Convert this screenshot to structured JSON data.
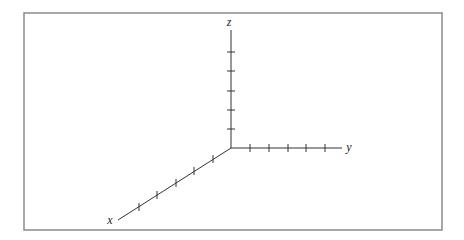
{
  "diagram": {
    "type": "3d-coordinate-axes",
    "frame": {
      "x": 24,
      "y": 13,
      "width": 418,
      "height": 217,
      "stroke": "#8a8a8a"
    },
    "origin": {
      "x": 231,
      "y": 148
    },
    "axis_color": "#333333",
    "axes": [
      {
        "name": "z",
        "label": "z",
        "end": {
          "x": 231,
          "y": 30
        },
        "label_pos": {
          "x": 229,
          "y": 26
        },
        "tick_count": 5,
        "ticks": [
          {
            "x": 231,
            "y": 129
          },
          {
            "x": 231,
            "y": 110
          },
          {
            "x": 231,
            "y": 91
          },
          {
            "x": 231,
            "y": 71
          },
          {
            "x": 231,
            "y": 52
          }
        ]
      },
      {
        "name": "y",
        "label": "y",
        "end": {
          "x": 342,
          "y": 148
        },
        "label_pos": {
          "x": 349,
          "y": 151
        },
        "tick_count": 5,
        "ticks": [
          {
            "x": 250,
            "y": 148
          },
          {
            "x": 269,
            "y": 148
          },
          {
            "x": 288,
            "y": 148
          },
          {
            "x": 306,
            "y": 148
          },
          {
            "x": 325,
            "y": 148
          }
        ]
      },
      {
        "name": "x",
        "label": "x",
        "end": {
          "x": 118,
          "y": 220
        },
        "label_pos": {
          "x": 110,
          "y": 224
        },
        "tick_count": 5,
        "ticks": [
          {
            "x": 213,
            "y": 159
          },
          {
            "x": 194,
            "y": 171
          },
          {
            "x": 176,
            "y": 183
          },
          {
            "x": 157,
            "y": 195
          },
          {
            "x": 139,
            "y": 207
          }
        ]
      }
    ]
  }
}
